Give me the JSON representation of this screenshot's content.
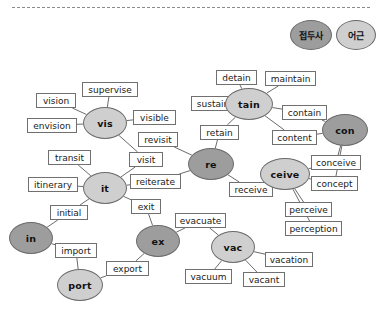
{
  "diagram": {
    "title_divider": "dashed-separator",
    "colors": {
      "prefix_fill": "#9d9d9d",
      "root_fill": "#cfcfcf",
      "box_fill": "#ffffff",
      "stroke": "#6b6b6b",
      "background": "#ffffff"
    },
    "legend": [
      {
        "label": "접두사",
        "type": "prefix",
        "x": 290,
        "y": 20,
        "w": 42,
        "h": 30
      },
      {
        "label": "어근",
        "type": "root",
        "x": 336,
        "y": 20,
        "w": 40,
        "h": 30
      }
    ],
    "nodes": [
      {
        "label": "vis",
        "type": "root",
        "cx": 105,
        "cy": 123,
        "rx": 22,
        "ry": 16
      },
      {
        "label": "it",
        "type": "root",
        "cx": 105,
        "cy": 188,
        "rx": 22,
        "ry": 16
      },
      {
        "label": "in",
        "type": "prefix",
        "cx": 31,
        "cy": 238,
        "rx": 22,
        "ry": 16
      },
      {
        "label": "port",
        "type": "root",
        "cx": 80,
        "cy": 285,
        "rx": 23,
        "ry": 16
      },
      {
        "label": "ex",
        "type": "prefix",
        "cx": 158,
        "cy": 241,
        "rx": 22,
        "ry": 16
      },
      {
        "label": "re",
        "type": "prefix",
        "cx": 211,
        "cy": 164,
        "rx": 23,
        "ry": 16
      },
      {
        "label": "tain",
        "type": "root",
        "cx": 249,
        "cy": 104,
        "rx": 24,
        "ry": 16
      },
      {
        "label": "con",
        "type": "prefix",
        "cx": 345,
        "cy": 130,
        "rx": 23,
        "ry": 16
      },
      {
        "label": "ceive",
        "type": "root",
        "cx": 285,
        "cy": 174,
        "rx": 25,
        "ry": 16
      },
      {
        "label": "vac",
        "type": "root",
        "cx": 233,
        "cy": 247,
        "rx": 22,
        "ry": 16
      }
    ],
    "boxes": [
      {
        "label": "supervise",
        "x": 82,
        "y": 82,
        "w": 56,
        "h": 15
      },
      {
        "label": "vision",
        "x": 36,
        "y": 93,
        "w": 40,
        "h": 15
      },
      {
        "label": "envision",
        "x": 27,
        "y": 118,
        "w": 50,
        "h": 15
      },
      {
        "label": "visible",
        "x": 133,
        "y": 110,
        "w": 43,
        "h": 15
      },
      {
        "label": "revisit",
        "x": 138,
        "y": 132,
        "w": 40,
        "h": 15
      },
      {
        "label": "visit",
        "x": 129,
        "y": 152,
        "w": 34,
        "h": 15
      },
      {
        "label": "transit",
        "x": 48,
        "y": 150,
        "w": 43,
        "h": 15
      },
      {
        "label": "itinerary",
        "x": 28,
        "y": 177,
        "w": 50,
        "h": 15
      },
      {
        "label": "reiterate",
        "x": 130,
        "y": 174,
        "w": 51,
        "h": 15
      },
      {
        "label": "initial",
        "x": 50,
        "y": 205,
        "w": 38,
        "h": 15
      },
      {
        "label": "exit",
        "x": 131,
        "y": 199,
        "w": 30,
        "h": 15
      },
      {
        "label": "import",
        "x": 55,
        "y": 243,
        "w": 42,
        "h": 15
      },
      {
        "label": "export",
        "x": 106,
        "y": 261,
        "w": 43,
        "h": 15
      },
      {
        "label": "evacuate",
        "x": 175,
        "y": 213,
        "w": 51,
        "h": 15
      },
      {
        "label": "vacuum",
        "x": 185,
        "y": 269,
        "w": 47,
        "h": 15
      },
      {
        "label": "vacant",
        "x": 243,
        "y": 272,
        "w": 42,
        "h": 15
      },
      {
        "label": "vacation",
        "x": 265,
        "y": 252,
        "w": 48,
        "h": 15
      },
      {
        "label": "receive",
        "x": 229,
        "y": 182,
        "w": 44,
        "h": 15
      },
      {
        "label": "retain",
        "x": 200,
        "y": 125,
        "w": 39,
        "h": 15
      },
      {
        "label": "sustain",
        "x": 191,
        "y": 96,
        "w": 44,
        "h": 15
      },
      {
        "label": "detain",
        "x": 216,
        "y": 70,
        "w": 41,
        "h": 15
      },
      {
        "label": "maintain",
        "x": 265,
        "y": 71,
        "w": 51,
        "h": 15
      },
      {
        "label": "contain",
        "x": 282,
        "y": 105,
        "w": 45,
        "h": 15
      },
      {
        "label": "content",
        "x": 272,
        "y": 130,
        "w": 45,
        "h": 15
      },
      {
        "label": "conceive",
        "x": 311,
        "y": 155,
        "w": 50,
        "h": 15
      },
      {
        "label": "concept",
        "x": 311,
        "y": 176,
        "w": 47,
        "h": 15
      },
      {
        "label": "perceive",
        "x": 285,
        "y": 202,
        "w": 47,
        "h": 15
      },
      {
        "label": "perception",
        "x": 285,
        "y": 221,
        "w": 57,
        "h": 15
      }
    ],
    "edges": [
      {
        "from": "vis",
        "to": "supervise"
      },
      {
        "from": "vis",
        "to": "vision"
      },
      {
        "from": "vis",
        "to": "envision"
      },
      {
        "from": "vis",
        "to": "visible"
      },
      {
        "from": "vis",
        "to": "visit"
      },
      {
        "from": "it",
        "to": "transit"
      },
      {
        "from": "it",
        "to": "itinerary"
      },
      {
        "from": "it",
        "to": "visit"
      },
      {
        "from": "it",
        "to": "reiterate"
      },
      {
        "from": "it",
        "to": "exit"
      },
      {
        "from": "it",
        "to": "initial"
      },
      {
        "from": "in",
        "to": "initial"
      },
      {
        "from": "in",
        "to": "import"
      },
      {
        "from": "port",
        "to": "import"
      },
      {
        "from": "port",
        "to": "export"
      },
      {
        "from": "ex",
        "to": "export"
      },
      {
        "from": "ex",
        "to": "exit"
      },
      {
        "from": "ex",
        "to": "evacuate"
      },
      {
        "from": "re",
        "to": "revisit"
      },
      {
        "from": "re",
        "to": "reiterate"
      },
      {
        "from": "re",
        "to": "retain"
      },
      {
        "from": "re",
        "to": "receive"
      },
      {
        "from": "tain",
        "to": "detain"
      },
      {
        "from": "tain",
        "to": "maintain"
      },
      {
        "from": "tain",
        "to": "sustain"
      },
      {
        "from": "tain",
        "to": "retain"
      },
      {
        "from": "tain",
        "to": "contain"
      },
      {
        "from": "tain",
        "to": "content"
      },
      {
        "from": "con",
        "to": "contain"
      },
      {
        "from": "con",
        "to": "content"
      },
      {
        "from": "con",
        "to": "conceive"
      },
      {
        "from": "con",
        "to": "concept"
      },
      {
        "from": "ceive",
        "to": "receive"
      },
      {
        "from": "ceive",
        "to": "conceive"
      },
      {
        "from": "ceive",
        "to": "concept"
      },
      {
        "from": "ceive",
        "to": "perceive"
      },
      {
        "from": "ceive",
        "to": "perception"
      },
      {
        "from": "vac",
        "to": "evacuate"
      },
      {
        "from": "vac",
        "to": "vacuum"
      },
      {
        "from": "vac",
        "to": "vacant"
      },
      {
        "from": "vac",
        "to": "vacation"
      }
    ]
  }
}
